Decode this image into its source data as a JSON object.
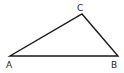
{
  "diagram": {
    "type": "triangle",
    "stroke_color": "#1a1a1a",
    "vertices": [
      {
        "id": "A",
        "label": "A",
        "x": 10,
        "y": 56
      },
      {
        "id": "B",
        "label": "B",
        "x": 118,
        "y": 56
      },
      {
        "id": "C",
        "label": "C",
        "x": 82,
        "y": 14
      }
    ],
    "labels": {
      "A": "A",
      "B": "B",
      "C": "C"
    }
  }
}
